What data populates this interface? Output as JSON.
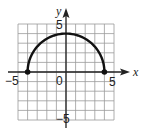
{
  "chart_data": {
    "type": "line",
    "title": "",
    "xlabel": "x",
    "ylabel": "y",
    "xlim": [
      -5,
      5
    ],
    "ylim": [
      -5,
      5
    ],
    "grid": true,
    "tick_labels": {
      "x": [
        "-5",
        "0",
        "5"
      ],
      "y": [
        "5",
        "-5"
      ]
    },
    "series": [
      {
        "name": "semicircle",
        "equation": "y = sqrt(16 - x^2)",
        "x": [
          -4,
          -3,
          -2,
          -1,
          0,
          1,
          2,
          3,
          4
        ],
        "y": [
          0,
          2.65,
          3.46,
          3.87,
          4,
          3.87,
          3.46,
          2.65,
          0
        ]
      }
    ],
    "endpoints": [
      {
        "x": -4,
        "y": 0,
        "closed": true
      },
      {
        "x": 4,
        "y": 0,
        "closed": true
      }
    ],
    "colors": {
      "curve": "#111111",
      "grid": "#9a9a9a",
      "axis": "#222222"
    }
  },
  "labels": {
    "x_axis": "x",
    "y_axis": "y",
    "x_min": "−5",
    "x_max": "5",
    "origin": "0",
    "y_max": "5",
    "y_min": "−5"
  }
}
